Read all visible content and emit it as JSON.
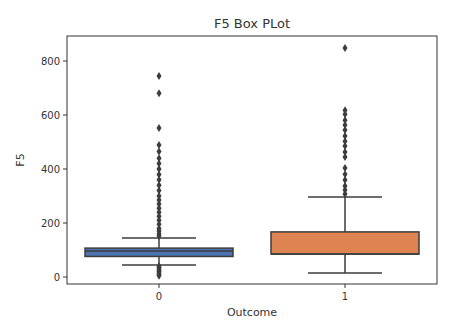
{
  "chart_data": {
    "type": "box",
    "title": "F5 Box PLot",
    "xlabel": "Outcome",
    "ylabel": "F5",
    "categories": [
      "0",
      "1"
    ],
    "ylim": [
      -30,
      880
    ],
    "yticks": [
      0,
      200,
      400,
      600,
      800
    ],
    "grid": false,
    "legend": null,
    "series": [
      {
        "name": "0",
        "color": "#4c72b0",
        "whisker_low": 44,
        "q1": 76,
        "median": 96,
        "q3": 107,
        "whisker_high": 144,
        "outliers_high": [
          744,
          681,
          552,
          489,
          465,
          440,
          420,
          400,
          380,
          360,
          340,
          320,
          300,
          285,
          270,
          255,
          240,
          225,
          210,
          195,
          180,
          170,
          160,
          152
        ],
        "outliers_low": [
          40,
          35,
          30,
          25,
          20,
          15,
          10,
          5
        ]
      },
      {
        "name": "1",
        "color": "#dd8452",
        "whisker_low": 15,
        "q1": 85,
        "median": 85,
        "q3": 167,
        "whisker_high": 296,
        "outliers_high": [
          848,
          618,
          603,
          581,
          563,
          544,
          522,
          503,
          485,
          463,
          444,
          404,
          381,
          359,
          337,
          322,
          307
        ]
      }
    ]
  }
}
